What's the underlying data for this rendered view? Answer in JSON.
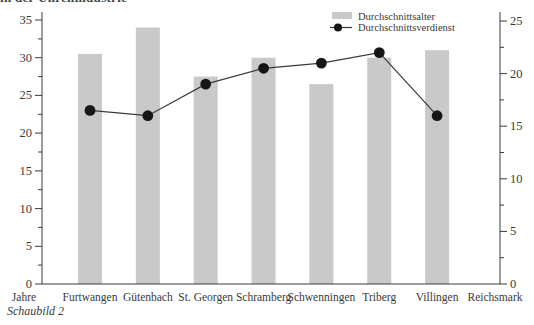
{
  "page": {
    "clipped_heading_fragment": "in der Uhrenindustrie",
    "caption": "Schaubild 2"
  },
  "chart_data": {
    "type": "bar+line combo",
    "categories": [
      "Furtwangen",
      "Gütenbach",
      "St. Georgen",
      "Schramberg",
      "Schwenningen",
      "Triberg",
      "Villingen"
    ],
    "series": [
      {
        "name": "Durchschnittsalter",
        "type": "bar",
        "axis": "left",
        "unit": "Jahre",
        "values": [
          30.5,
          34,
          27.5,
          30,
          26.5,
          30,
          31
        ],
        "color": "#c9c9c9"
      },
      {
        "name": "Durchschnittsverdienst",
        "type": "line",
        "axis": "right",
        "unit": "Reichsmark",
        "values": [
          16.5,
          16,
          19,
          20.5,
          21,
          22,
          16
        ],
        "color": "#2a2a2a"
      }
    ],
    "left_axis": {
      "label": "Jahre",
      "min": 0,
      "max": 35,
      "major_tick_step": 5,
      "minor_tick_step": 2.5,
      "tick_labels": [
        "0",
        "5",
        "10",
        "15",
        "20",
        "25",
        "30",
        "35"
      ]
    },
    "right_axis": {
      "label": "Reichsmark",
      "min": 0,
      "max": 25,
      "major_tick_step": 5,
      "minor_tick_step": 2.5,
      "tick_labels": [
        "0",
        "5",
        "10",
        "15",
        "20",
        "25"
      ]
    },
    "legend": {
      "position": "top-right",
      "entries": [
        "Durchschnittsalter",
        "Durchschnittsverdienst"
      ]
    },
    "grid": "off",
    "background": "#ffffff"
  }
}
